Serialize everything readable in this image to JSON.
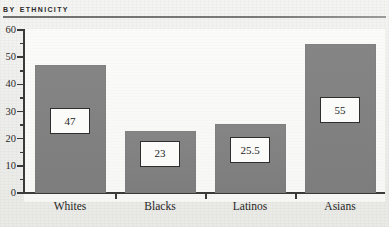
{
  "header": {
    "title": "By Ethnicity"
  },
  "chart_data": {
    "type": "bar",
    "title": "By Ethnicity",
    "xlabel": "",
    "ylabel": "",
    "categories": [
      "Whites",
      "Blacks",
      "Latinos",
      "Asians"
    ],
    "values": [
      47,
      23,
      25.5,
      55
    ],
    "value_labels": [
      "47",
      "23",
      "25.5",
      "55"
    ],
    "ylim": [
      0,
      60
    ],
    "y_major_ticks": [
      0,
      10,
      20,
      30,
      40,
      50,
      60
    ],
    "y_tick_labels": [
      "0",
      "10",
      "20",
      "30",
      "40",
      "50",
      "60"
    ],
    "y_minor_ticks": [
      5,
      15,
      25,
      35,
      45,
      55
    ],
    "grid": false,
    "legend": null,
    "bar_color": "#818181",
    "axis_color": "#3a3a3a",
    "label_box_fill": "#fbfbf9",
    "label_box_border": "#2e2e2e"
  }
}
